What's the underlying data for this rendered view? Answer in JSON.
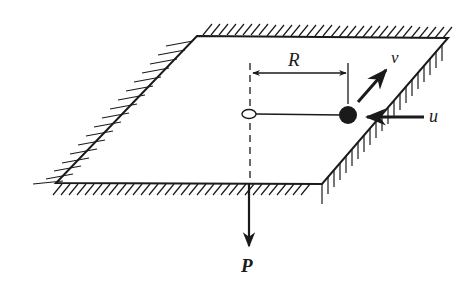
{
  "figure": {
    "labels": {
      "radius": "R",
      "velocity": "v",
      "velocity_perp": "u",
      "force": "P"
    },
    "colors": {
      "ink": "#1a1a1a",
      "background": "#ffffff"
    },
    "elements": {
      "table": "parallelogram plane with hatched edges",
      "hole": "open ellipse at center",
      "mass": "filled black ball",
      "string": "line from hole to ball",
      "axis": "dashed vertical line through hole",
      "dimension": "double-headed arrow marking R"
    }
  }
}
